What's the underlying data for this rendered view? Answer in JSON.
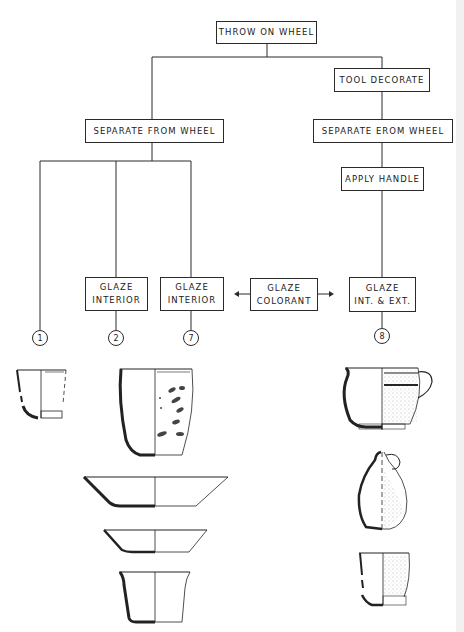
{
  "diagram": {
    "type": "process-flowchart",
    "nodes": {
      "throw": {
        "label": "THROW ON WHEEL"
      },
      "tool_decorate": {
        "label": "TOOL DECORATE"
      },
      "separate_left": {
        "label": "SEPARATE FROM WHEEL"
      },
      "separate_right": {
        "label": "SEPARATE EROM WHEEL"
      },
      "apply_handle": {
        "label": "APPLY HANDLE"
      },
      "glaze_interior_a": {
        "line1": "GLAZE",
        "line2": "INTERIOR"
      },
      "glaze_interior_b": {
        "line1": "GLAZE",
        "line2": "INTERIOR"
      },
      "glaze_colorant": {
        "line1": "GLAZE",
        "line2": "COLORANT"
      },
      "glaze_int_ext": {
        "line1": "GLAZE",
        "line2": "INT. & EXT."
      }
    },
    "outcomes": [
      {
        "id": "1",
        "label": "1"
      },
      {
        "id": "2",
        "label": "2"
      },
      {
        "id": "7",
        "label": "7"
      },
      {
        "id": "8",
        "label": "8"
      }
    ],
    "edges": [
      [
        "THROW ON WHEEL",
        "SEPARATE FROM WHEEL"
      ],
      [
        "THROW ON WHEEL",
        "TOOL DECORATE"
      ],
      [
        "TOOL DECORATE",
        "SEPARATE EROM WHEEL"
      ],
      [
        "SEPARATE EROM WHEEL",
        "APPLY HANDLE"
      ],
      [
        "APPLY HANDLE",
        "GLAZE INT. & EXT."
      ],
      [
        "SEPARATE FROM WHEEL",
        "1"
      ],
      [
        "SEPARATE FROM WHEEL",
        "GLAZE INTERIOR (2)"
      ],
      [
        "SEPARATE FROM WHEEL",
        "GLAZE INTERIOR (7)"
      ],
      [
        "GLAZE COLORANT",
        "GLAZE INTERIOR (7)"
      ],
      [
        "GLAZE COLORANT",
        "GLAZE INT. & EXT."
      ],
      [
        "GLAZE INTERIOR (2)",
        "2"
      ],
      [
        "GLAZE INTERIOR (7)",
        "7"
      ],
      [
        "GLAZE INT. & EXT.",
        "8"
      ]
    ],
    "vessel_drawings": {
      "type_1": [
        "small cup with foot ring"
      ],
      "type_7": [
        "beaker with painted/sprigged exterior",
        "wide shallow bowl",
        "small shallow dish",
        "flared straight-sided cup"
      ],
      "type_8": [
        "handled cup with bands, stippled exterior",
        "jug with handle, stippled exterior",
        "small cup with foot, stippled exterior"
      ]
    }
  }
}
